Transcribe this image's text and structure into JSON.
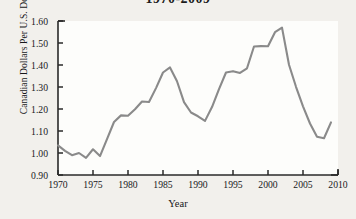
{
  "chart_data": {
    "type": "line",
    "title": "1970-2009",
    "xlabel": "Year",
    "ylabel": "Canadian Dollars Per U.S. Dollar",
    "xlim": [
      1970,
      2010
    ],
    "ylim": [
      0.9,
      1.6
    ],
    "xticks": [
      1970,
      1975,
      1980,
      1985,
      1990,
      1995,
      2000,
      2005,
      2010
    ],
    "xtick_labels": [
      "1970",
      "1975",
      "1980",
      "1985",
      "1990",
      "1995",
      "2000",
      "2005",
      "2010"
    ],
    "yticks": [
      0.9,
      1.0,
      1.1,
      1.2,
      1.3,
      1.4,
      1.5,
      1.6
    ],
    "ytick_labels": [
      "0.90",
      "1.00",
      "1.10",
      "1.20",
      "1.30",
      "1.40",
      "1.50",
      "1.60"
    ],
    "grid": false,
    "legend": false,
    "line_color": "#8a8a8a",
    "axis_color": "#2a2a2a",
    "background": "#f2f0ec",
    "plot_background": "#fdfdfb",
    "x": [
      1970,
      1971,
      1972,
      1973,
      1974,
      1975,
      1976,
      1977,
      1978,
      1979,
      1980,
      1981,
      1982,
      1983,
      1984,
      1985,
      1986,
      1987,
      1988,
      1989,
      1990,
      1991,
      1992,
      1993,
      1994,
      1995,
      1996,
      1997,
      1998,
      1999,
      2000,
      2001,
      2002,
      2003,
      2004,
      2005,
      2006,
      2007,
      2008,
      2009
    ],
    "values": [
      1.035,
      1.01,
      0.99,
      1.0,
      0.978,
      1.017,
      0.986,
      1.063,
      1.141,
      1.171,
      1.169,
      1.199,
      1.234,
      1.232,
      1.295,
      1.366,
      1.389,
      1.326,
      1.231,
      1.184,
      1.167,
      1.146,
      1.209,
      1.29,
      1.366,
      1.372,
      1.364,
      1.385,
      1.484,
      1.486,
      1.485,
      1.549,
      1.57,
      1.401,
      1.301,
      1.212,
      1.134,
      1.074,
      1.067,
      1.139
    ],
    "series_name": "Canadian Dollars Per U.S. Dollar"
  },
  "figure": {
    "caption_title": "1970-2009"
  }
}
